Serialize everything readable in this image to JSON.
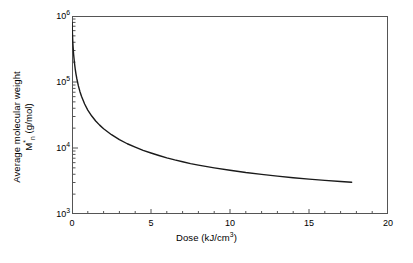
{
  "chart_data": {
    "type": "line",
    "title": "",
    "xlabel": "Dose (kJ/cm3)",
    "ylabel_line1": "Average molecular weight",
    "ylabel_line2": "Mn (g/mol)",
    "xlim": [
      0,
      20
    ],
    "ylim": [
      1000,
      1000000
    ],
    "yscale": "log",
    "xscale": "linear",
    "grid": false,
    "legend": null,
    "xticks": [
      0,
      5,
      10,
      15,
      20
    ],
    "xtick_labels": [
      "0",
      "5",
      "10",
      "15",
      "20"
    ],
    "yticks": [
      1000,
      10000,
      100000,
      1000000
    ],
    "ytick_labels": [
      "10³",
      "10⁴",
      "10⁵",
      "10⁶"
    ],
    "ytick_mantissas": [
      "3",
      "4",
      "5",
      "6"
    ],
    "series": [
      {
        "name": "Mn vs dose",
        "color": "#1a1a1a",
        "x": [
          0.0,
          0.05,
          0.1,
          0.15,
          0.2,
          0.25,
          0.3,
          0.4,
          0.5,
          0.6,
          0.8,
          1.0,
          1.25,
          1.5,
          1.75,
          2.0,
          2.5,
          3.0,
          3.5,
          4.0,
          4.5,
          5.0,
          5.5,
          6.0,
          6.5,
          7.0,
          7.5,
          8.0,
          9.0,
          10.0,
          11.0,
          12.0,
          13.0,
          14.0,
          15.0,
          16.0,
          17.0,
          17.7
        ],
        "y": [
          800000,
          400000,
          266000,
          200000,
          160000,
          133000,
          114000,
          88000,
          72000,
          61000,
          46500,
          37500,
          30500,
          25700,
          22200,
          19600,
          15900,
          13400,
          11600,
          10300,
          9200,
          8400,
          7700,
          7100,
          6600,
          6200,
          5800,
          5500,
          5000,
          4600,
          4250,
          3980,
          3750,
          3550,
          3380,
          3230,
          3100,
          3020
        ]
      }
    ],
    "annotations": []
  },
  "axes": {
    "x_tick_labels": [
      "0",
      "5",
      "10",
      "15",
      "20"
    ],
    "y_tick_exponents": [
      "6",
      "5",
      "4",
      "3"
    ],
    "y_tick_base": "10"
  },
  "labels": {
    "x_title_main": "Dose (kJ/cm",
    "x_title_exp": "3",
    "x_title_close": ")",
    "y_title_top": "Average molecular weight",
    "y_title_base": "M",
    "y_title_sub": "n",
    "y_title_units": " (g/mol)",
    "y_title_star": "*"
  },
  "style": {
    "frame_color": "#555555",
    "curve_color": "#1a1a1a",
    "background": "#ffffff",
    "tick_color": "#555555"
  }
}
